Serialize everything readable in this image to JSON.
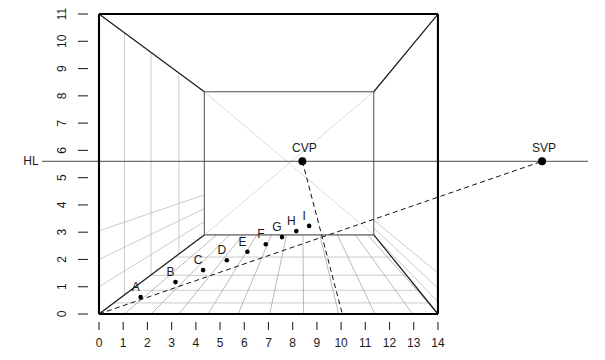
{
  "figure": {
    "title": "",
    "horizon_label": "HL",
    "vanishing_points": [
      {
        "name": "CVP",
        "x": 8.4,
        "y": 5.6,
        "label": "CVP"
      },
      {
        "name": "SVP",
        "x": 18.3,
        "y": 5.6,
        "label": "SVP"
      }
    ],
    "axes": {
      "x_ticks": [
        0,
        1,
        2,
        3,
        4,
        5,
        6,
        7,
        8,
        9,
        10,
        11,
        12,
        13,
        14
      ],
      "y_ticks": [
        0,
        1,
        2,
        3,
        4,
        5,
        6,
        7,
        8,
        9,
        10,
        11
      ],
      "xlim": [
        0,
        14
      ],
      "ylim": [
        0,
        11
      ],
      "xlabel": "",
      "ylabel": ""
    },
    "outer_box": {
      "x0": 0,
      "y0": 0,
      "x1": 14,
      "y1": 11
    },
    "inner_box": {
      "x0": 4.35,
      "y0": 2.9,
      "x1": 11.35,
      "y1": 8.15
    },
    "horizon_line_y": 5.6,
    "measuring_points": [
      {
        "label": "A",
        "x": 1.72,
        "y": 0.62
      },
      {
        "label": "B",
        "x": 3.16,
        "y": 1.17
      },
      {
        "label": "C",
        "x": 4.3,
        "y": 1.61
      },
      {
        "label": "D",
        "x": 5.28,
        "y": 1.97
      },
      {
        "label": "E",
        "x": 6.13,
        "y": 2.28
      },
      {
        "label": "F",
        "x": 6.89,
        "y": 2.56
      },
      {
        "label": "G",
        "x": 7.56,
        "y": 2.82
      },
      {
        "label": "H",
        "x": 8.15,
        "y": 3.04
      },
      {
        "label": "I",
        "x": 8.68,
        "y": 3.23
      }
    ]
  },
  "chart_data": {
    "type": "line",
    "xlabel": "",
    "ylabel": "",
    "xlim": [
      0,
      14
    ],
    "ylim": [
      0,
      11
    ],
    "grid": false,
    "legend": "none",
    "annotations": [
      "HL",
      "CVP",
      "SVP",
      "A",
      "B",
      "C",
      "D",
      "E",
      "F",
      "G",
      "H",
      "I"
    ],
    "series": [
      {
        "name": "horizon-line",
        "x": [
          -1.2,
          21.0
        ],
        "values": [
          5.6,
          5.6
        ]
      },
      {
        "name": "picture-plane-outer-box",
        "x": [
          0,
          14,
          14,
          0,
          0
        ],
        "values": [
          0,
          0,
          11,
          11,
          0
        ]
      },
      {
        "name": "back-wall-inner-box",
        "x": [
          4.35,
          11.35,
          11.35,
          4.35,
          4.35
        ],
        "values": [
          2.9,
          2.9,
          8.15,
          8.15,
          2.9
        ]
      },
      {
        "name": "diagonal-measuring-line-to-SVP",
        "x": [
          0,
          18.3
        ],
        "values": [
          0,
          5.6
        ]
      },
      {
        "name": "orthogonal-corner-bottom-left",
        "x": [
          0,
          4.35
        ],
        "values": [
          0,
          2.9
        ]
      },
      {
        "name": "orthogonal-corner-bottom-right",
        "x": [
          14,
          11.35
        ],
        "values": [
          0,
          2.9
        ]
      },
      {
        "name": "orthogonal-corner-top-left",
        "x": [
          0,
          4.35
        ],
        "values": [
          11,
          8.15
        ]
      },
      {
        "name": "orthogonal-corner-top-right",
        "x": [
          14,
          11.35
        ],
        "values": [
          11,
          8.15
        ]
      },
      {
        "name": "floor-grid-convergence-rays",
        "x": [
          8.4
        ],
        "values": [
          5.6
        ]
      }
    ],
    "points": [
      {
        "label": "A",
        "x": 1.72,
        "y": 0.62
      },
      {
        "label": "B",
        "x": 3.16,
        "y": 1.17
      },
      {
        "label": "C",
        "x": 4.3,
        "y": 1.61
      },
      {
        "label": "D",
        "x": 5.28,
        "y": 1.97
      },
      {
        "label": "E",
        "x": 6.13,
        "y": 2.28
      },
      {
        "label": "F",
        "x": 6.89,
        "y": 2.56
      },
      {
        "label": "G",
        "x": 7.56,
        "y": 2.82
      },
      {
        "label": "H",
        "x": 8.15,
        "y": 3.04
      },
      {
        "label": "I",
        "x": 8.68,
        "y": 3.23
      },
      {
        "label": "CVP",
        "x": 8.4,
        "y": 5.6
      },
      {
        "label": "SVP",
        "x": 18.3,
        "y": 5.6
      }
    ],
    "colors": {
      "axis": "#1a1a1a",
      "construction": "#8a8a8a",
      "heavy": "#000000",
      "dashed": "#000000"
    }
  }
}
